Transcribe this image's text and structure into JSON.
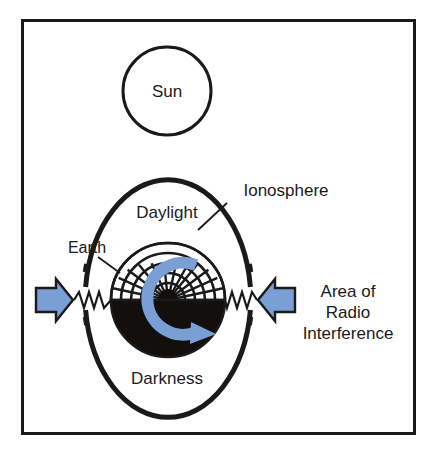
{
  "figure": {
    "name": "ionosphere-radio-interference-diagram",
    "background_color": "#ffffff",
    "frame_color": "#1a1a1a"
  },
  "colors": {
    "ink": "#1a1a1a",
    "blue_fill": "#7a9fd4",
    "blue_arrow_fill": "#7a9fd4",
    "blue_arrow_stroke": "#1a1a1a",
    "dark_side_fill": "#120f0d",
    "light_side_fill": "#ffffff"
  },
  "labels": {
    "sun": "Sun",
    "daylight": "Daylight",
    "darkness": "Darkness",
    "earth": "Earth",
    "ionosphere": "Ionosphere",
    "area_line1": "Area of",
    "area_line2": "Radio",
    "area_line3": "Interference"
  },
  "icons": {
    "arrow_left_source": "arrow-right-icon",
    "arrow_right_source": "arrow-left-icon",
    "rotation": "circular-arrow-icon",
    "signal_left": "zigzag-signal-icon",
    "signal_right": "zigzag-signal-icon"
  },
  "geometry": {
    "frame": {
      "x": 21,
      "y": 19,
      "width": 394,
      "height": 415,
      "stroke_width": 3
    },
    "sun": {
      "cx": 167,
      "cy": 91,
      "r": 45,
      "stroke_width": 3
    },
    "ionosphere": {
      "cx": 168,
      "cy": 297,
      "rx": 83,
      "ry": 122,
      "stroke_width": 5
    },
    "earth": {
      "cx": 168,
      "cy": 300,
      "r": 57
    },
    "terminator_y": 300,
    "grid": {
      "arc_count": 6,
      "spoke_count": 15
    }
  }
}
